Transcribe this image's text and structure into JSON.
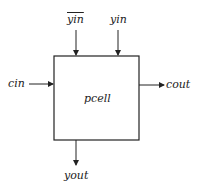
{
  "diagram": {
    "block": {
      "label": "pcell"
    },
    "ports": {
      "yin_bar": {
        "label": "yin",
        "negated": true,
        "direction": "input"
      },
      "yin": {
        "label": "yin",
        "direction": "input"
      },
      "cin": {
        "label": "cin",
        "direction": "input"
      },
      "cout": {
        "label": "cout",
        "direction": "output"
      },
      "yout": {
        "label": "yout",
        "direction": "output"
      }
    },
    "colors": {
      "line": "#222222",
      "background": "#ffffff"
    }
  }
}
